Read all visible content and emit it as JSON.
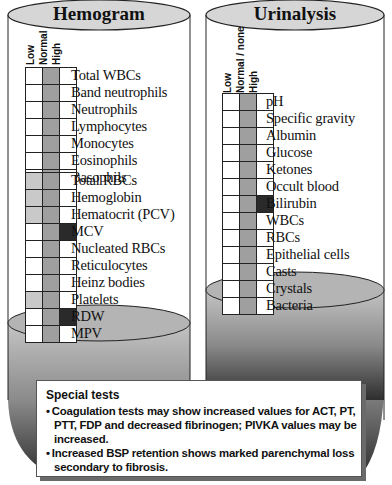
{
  "hemogram": {
    "title": "Hemogram",
    "column_headers": [
      "Low",
      "Normal",
      "High"
    ],
    "group1": [
      {
        "label": "Total WBCs",
        "status": "normal"
      },
      {
        "label": "Band neutrophils",
        "status": "normal"
      },
      {
        "label": "Neutrophils",
        "status": "normal"
      },
      {
        "label": "Lymphocytes",
        "status": "normal"
      },
      {
        "label": "Monocytes",
        "status": "normal"
      },
      {
        "label": "Eosinophils",
        "status": "normal"
      },
      {
        "label": "Basophils",
        "status": "normal"
      }
    ],
    "group2": [
      {
        "label": "Total RBCs",
        "status": "low-normal"
      },
      {
        "label": "Hemoglobin",
        "status": "low-normal"
      },
      {
        "label": "Hematocrit (PCV)",
        "status": "low-normal"
      },
      {
        "label": "MCV",
        "status": "normal-high"
      },
      {
        "label": "Nucleated RBCs",
        "status": "normal"
      },
      {
        "label": "Reticulocytes",
        "status": "normal"
      },
      {
        "label": "Heinz bodies",
        "status": "normal"
      },
      {
        "label": "Platelets",
        "status": "low-normal"
      },
      {
        "label": "RDW",
        "status": "normal-high"
      },
      {
        "label": "MPV",
        "status": "normal"
      }
    ]
  },
  "urinalysis": {
    "title": "Urinalysis",
    "column_headers": [
      "Low",
      "Normal / none",
      "High"
    ],
    "rows": [
      {
        "label": "pH",
        "status": "normal"
      },
      {
        "label": "Specific gravity",
        "status": "normal"
      },
      {
        "label": "Albumin",
        "status": "normal"
      },
      {
        "label": "Glucose",
        "status": "normal"
      },
      {
        "label": "Ketones",
        "status": "normal"
      },
      {
        "label": "Occult blood",
        "status": "normal"
      },
      {
        "label": "Bilirubin",
        "status": "normal-high"
      },
      {
        "label": "WBCs",
        "status": "normal"
      },
      {
        "label": "RBCs",
        "status": "normal"
      },
      {
        "label": "Epithelial cells",
        "status": "normal"
      },
      {
        "label": "Casts",
        "status": "normal"
      },
      {
        "label": "Crystals",
        "status": "normal"
      },
      {
        "label": "Bacteria",
        "status": "normal"
      }
    ]
  },
  "special_tests": {
    "heading": "Special tests",
    "items": [
      "Coagulation tests may show increased values for ACT, PT, PTT, FDP and decreased fibrinogen; PIVKA values may be increased.",
      "Increased BSP retention shows marked parenchymal loss secondary to fibrosis."
    ]
  },
  "colors": {
    "normal_cell": "#9f9f9f",
    "low_cell": "#c9c9c9",
    "high_cell": "#2a2a2a",
    "cylinder_top": "#d6d6d6"
  }
}
